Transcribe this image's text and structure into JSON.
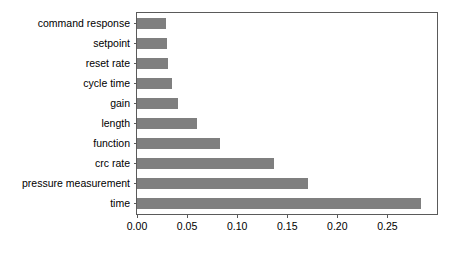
{
  "chart_data": {
    "type": "bar",
    "orientation": "horizontal",
    "title": "",
    "xlabel": "",
    "ylabel": "",
    "categories": [
      "command response",
      "setpoint",
      "reset rate",
      "cycle time",
      "gain",
      "length",
      "function",
      "crc rate",
      "pressure measurement",
      "time"
    ],
    "values": [
      0.029,
      0.03,
      0.031,
      0.035,
      0.041,
      0.06,
      0.083,
      0.137,
      0.171,
      0.284
    ],
    "xlim": [
      0.0,
      0.2995
    ],
    "xticks": [
      0.0,
      0.05,
      0.1,
      0.15,
      0.2,
      0.25
    ],
    "xticklabels": [
      "0.00",
      "0.05",
      "0.10",
      "0.15",
      "0.20",
      "0.25"
    ],
    "grid": false,
    "legend": null,
    "bar_color": "#7f7f7f",
    "frame_color": "#5a5a5a",
    "background_color": "#ffffff"
  }
}
